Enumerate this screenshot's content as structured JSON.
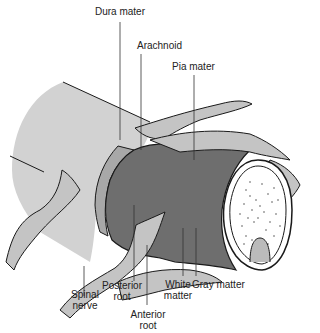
{
  "diagram": {
    "colors": {
      "outer_tube": "#d2d2d2",
      "dura_band": "#a8a8a8",
      "pia_cylinder": "#6e6e6e",
      "nerve_root": "#c4c4c4",
      "outline": "#1a1a1a",
      "leader_line": "#333333",
      "gray_matter_dots": "#555555",
      "white_matter": "#ffffff"
    },
    "labels": {
      "dura_mater": "Dura mater",
      "arachnoid": "Arachnoid",
      "pia_mater": "Pia mater",
      "spinal_nerve_line1": "Spinal",
      "spinal_nerve_line2": "nerve",
      "posterior_root_line1": "Posterior",
      "posterior_root_line2": "root",
      "anterior_root_line1": "Anterior",
      "anterior_root_line2": "root",
      "white_matter_line1": "White",
      "white_matter_line2": "matter",
      "gray_matter": "Gray matter"
    }
  }
}
